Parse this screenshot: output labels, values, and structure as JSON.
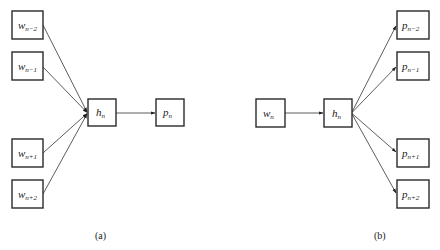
{
  "diagram": {
    "panels": [
      {
        "id": "a",
        "caption": "(a)",
        "nodes": [
          {
            "id": "w_n-2",
            "base": "w",
            "sub": "n−2"
          },
          {
            "id": "w_n-1",
            "base": "w",
            "sub": "n−1"
          },
          {
            "id": "w_n+1",
            "base": "w",
            "sub": "n+1"
          },
          {
            "id": "w_n+2",
            "base": "w",
            "sub": "n+2"
          },
          {
            "id": "h_n",
            "base": "h",
            "sub": "n"
          },
          {
            "id": "p_n",
            "base": "p",
            "sub": "n"
          }
        ],
        "edges": [
          {
            "from": "w_n-2",
            "to": "h_n"
          },
          {
            "from": "w_n-1",
            "to": "h_n"
          },
          {
            "from": "w_n+1",
            "to": "h_n"
          },
          {
            "from": "w_n+2",
            "to": "h_n"
          },
          {
            "from": "h_n",
            "to": "p_n"
          }
        ]
      },
      {
        "id": "b",
        "caption": "(b)",
        "nodes": [
          {
            "id": "w_n",
            "base": "w",
            "sub": "n"
          },
          {
            "id": "h_n",
            "base": "h",
            "sub": "n"
          },
          {
            "id": "p_n-2",
            "base": "p",
            "sub": "n−2"
          },
          {
            "id": "p_n-1",
            "base": "p",
            "sub": "n−1"
          },
          {
            "id": "p_n+1",
            "base": "p",
            "sub": "n+1"
          },
          {
            "id": "p_n+2",
            "base": "p",
            "sub": "n+2"
          }
        ],
        "edges": [
          {
            "from": "w_n",
            "to": "h_n"
          },
          {
            "from": "h_n",
            "to": "p_n-2"
          },
          {
            "from": "h_n",
            "to": "p_n-1"
          },
          {
            "from": "h_n",
            "to": "p_n+1"
          },
          {
            "from": "h_n",
            "to": "p_n+2"
          }
        ]
      }
    ]
  }
}
